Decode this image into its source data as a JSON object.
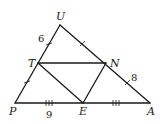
{
  "diagram": {
    "type": "triangle-midsegment",
    "colors": {
      "stroke": "#1a1a1a",
      "background": "#ffffff"
    },
    "points": {
      "U": {
        "label": "U"
      },
      "T": {
        "label": "T"
      },
      "N": {
        "label": "N"
      },
      "P": {
        "label": "P"
      },
      "E": {
        "label": "E"
      },
      "A": {
        "label": "A"
      }
    },
    "segments": [
      "UP",
      "UA",
      "PA",
      "TN",
      "TE",
      "NE"
    ],
    "measurements": {
      "UT": "6",
      "NA": "8",
      "PE": "9"
    },
    "tick_marks": {
      "UT": 1,
      "TP": 1,
      "UN": 1,
      "NA": 1,
      "PE": 3,
      "EA": 3
    }
  }
}
